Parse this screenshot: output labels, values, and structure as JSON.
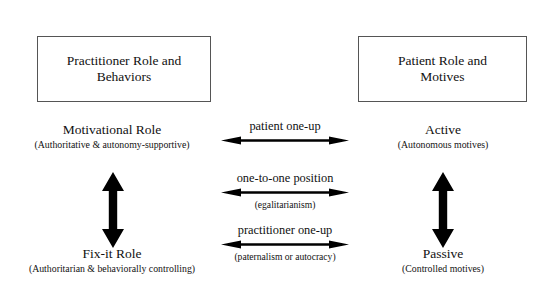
{
  "figure": {
    "type": "conceptual-diagram",
    "background_color": "#ffffff",
    "line_color": "#000000",
    "box_border_color": "#555555"
  },
  "boxes": {
    "practitioner": {
      "label": "Practitioner Role and\nBehaviors"
    },
    "patient": {
      "label": "Patient Role and\nMotives"
    }
  },
  "poles": {
    "motivational": {
      "title": "Motivational Role",
      "subtitle": "(Authoritative & autonomy-supportive)"
    },
    "fixit": {
      "title": "Fix-it Role",
      "subtitle": "(Authoritarian & behaviorally controlling)"
    },
    "active": {
      "title": "Active",
      "subtitle": "(Autonomous motives)"
    },
    "passive": {
      "title": "Passive",
      "subtitle": "(Controlled motives)"
    }
  },
  "connectors": {
    "patient_one_up": {
      "label": "patient one-up",
      "subtitle": "",
      "icon": "double-headed-horizontal-arrow-icon"
    },
    "one_to_one": {
      "label": "one-to-one position",
      "subtitle": "(egalitarianism)",
      "icon": "double-headed-horizontal-arrow-icon"
    },
    "practitioner_one_up": {
      "label": "practitioner one-up",
      "subtitle": "(paternalism or autocracy)",
      "icon": "double-headed-horizontal-arrow-icon"
    }
  },
  "vertical_arrows": {
    "left": {
      "icon": "double-headed-vertical-arrow-icon"
    },
    "right": {
      "icon": "double-headed-vertical-arrow-icon"
    }
  }
}
